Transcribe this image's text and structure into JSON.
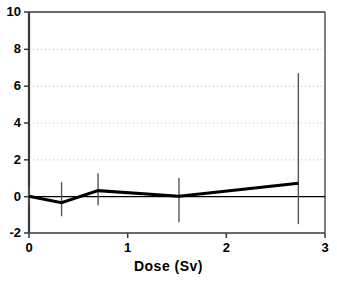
{
  "chart_data": {
    "type": "line",
    "title": "",
    "subtitle": "",
    "xlabel": "Dose (Sv)",
    "ylabel": "",
    "xlim": [
      0,
      3
    ],
    "ylim": [
      -2,
      10
    ],
    "xticks": [
      "0",
      "1",
      "2",
      "3"
    ],
    "xtick_values": [
      0,
      1,
      2,
      3
    ],
    "yticks": [
      "-2",
      "0",
      "2",
      "4",
      "6",
      "8",
      "10"
    ],
    "ytick_values": [
      -2,
      0,
      2,
      4,
      6,
      8,
      10
    ],
    "grid": "horizontal-dotted",
    "gridlines_y": [
      2,
      4,
      6,
      8
    ],
    "legend": "none",
    "zero_reference_line": 0,
    "series": [
      {
        "name": "excess relative risk",
        "x": [
          0,
          0.33,
          0.7,
          1.52,
          2.73
        ],
        "values": [
          0.0,
          -0.35,
          0.3,
          0.0,
          0.7
        ],
        "error_upper": [
          0.54,
          0.76,
          1.25,
          0.98,
          6.68
        ],
        "error_lower": [
          -0.49,
          -1.09,
          -0.49,
          -1.41,
          -1.52
        ],
        "line_color": "#000000",
        "errorbar_color": "#555555",
        "line_width": 3
      }
    ],
    "colors": {
      "axis": "#3a3a3a",
      "grid": "#b4b4b4",
      "line": "#000000",
      "errorbar": "#606060",
      "background": "#ffffff",
      "text": "#000000"
    }
  },
  "plot_geometry": {
    "left_px": 29,
    "right_px": 325,
    "top_px": 12,
    "bottom_px": 233
  }
}
